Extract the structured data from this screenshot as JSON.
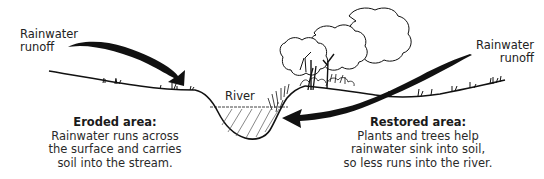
{
  "diagram": {
    "labels": {
      "left_runoff": [
        "Rainwater",
        "runoff"
      ],
      "right_runoff": [
        "Rainwater",
        "runoff"
      ],
      "river": "River"
    },
    "eroded": {
      "title": "Eroded area:",
      "lines": [
        "Rainwater runs across",
        "the surface and carries",
        "soil into the stream."
      ]
    },
    "restored": {
      "title": "Restored area:",
      "lines": [
        "Plants and trees help",
        "rainwater sink into soil,",
        "so less runs into the river."
      ]
    },
    "colors": {
      "ink": "#111111",
      "text": "#2a2a2a",
      "background": "#ffffff"
    }
  }
}
